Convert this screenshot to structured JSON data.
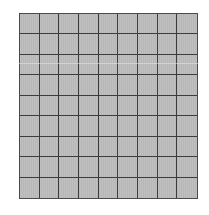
{
  "grid": {
    "rows": 9,
    "columns": 9,
    "cell_color": "#bdbdbd",
    "line_color": "#3c3c3c",
    "background": "#ffffff"
  }
}
